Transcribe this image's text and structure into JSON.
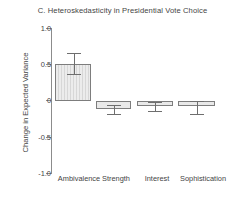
{
  "chart_data": {
    "type": "bar",
    "title": "C. Heteroskedasticity in Presidential Vote Choice",
    "xlabel": "",
    "ylabel": "Change in Expected Variance",
    "categories": [
      "Ambivalence",
      "Strength",
      "Interest",
      "Sophistication"
    ],
    "values": [
      0.5,
      -0.12,
      -0.07,
      -0.08
    ],
    "errors_low": [
      0.36,
      -0.18,
      -0.14,
      -0.18
    ],
    "errors_high": [
      0.65,
      -0.06,
      -0.02,
      -0.01
    ],
    "ylim": [
      -1.0,
      1.0
    ],
    "ytick_labels": [
      "1.0",
      "0.5",
      "0",
      "-0.5",
      "-1.0"
    ],
    "ytick_values": [
      1.0,
      0.5,
      0,
      -0.5,
      -1.0
    ],
    "grid": false,
    "legend": "none",
    "bar_facecolor": "#e9e9e9",
    "bar_edgecolor": "#7d7d7d",
    "axis_color": "#8c8c8c",
    "text_color": "#444444"
  }
}
